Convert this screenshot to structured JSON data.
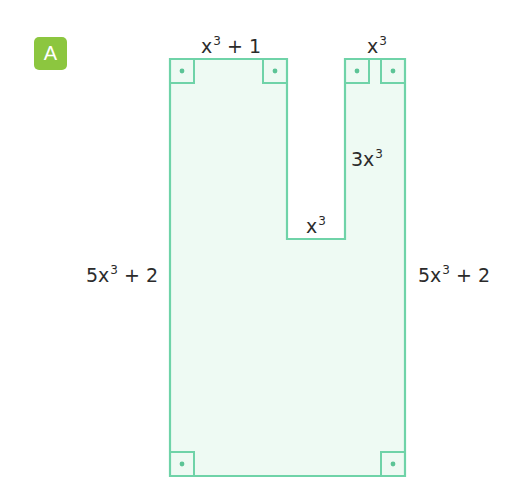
{
  "badge": {
    "letter": "A",
    "color": "#8cc63f"
  },
  "figure": {
    "shape": "U-shaped rectilinear polygon (rectangle with rectangular notch cut from top)",
    "stroke_color": "#6fd3a8",
    "fill_color": "#eefaf3",
    "right_angle_markers": 6,
    "labels": {
      "top_left": {
        "base": "x",
        "exp": "3",
        "suffix": " + 1"
      },
      "top_right": {
        "base": "x",
        "exp": "3",
        "suffix": ""
      },
      "notch_right": {
        "base": "3x",
        "exp": "3",
        "suffix": ""
      },
      "notch_bottom": {
        "base": "x",
        "exp": "3",
        "suffix": ""
      },
      "left_side": {
        "base": "5x",
        "exp": "3",
        "suffix": " + 2"
      },
      "right_side": {
        "base": "5x",
        "exp": "3",
        "suffix": " + 2"
      }
    }
  }
}
